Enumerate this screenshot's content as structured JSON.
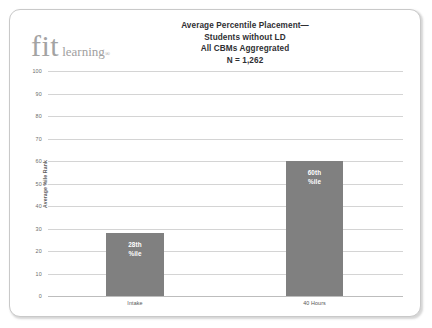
{
  "logo": {
    "primary": "fit",
    "secondary": "learning",
    "registered": "®"
  },
  "title": {
    "line1": "Average Percentile Placement—",
    "line2": "Students without LD",
    "line3": "All CBMs Aggregrated",
    "line4": "N = 1,262"
  },
  "colors": {
    "bar": "#808080",
    "gridline": "#d4d4d4",
    "title_text": "#2f2f33",
    "logo": "#a3a3a3",
    "bar_label": "#ffffff"
  },
  "chart_data": {
    "type": "bar",
    "title": "Average Percentile Placement— Students without LD All CBMs Aggregrated N = 1,262",
    "xlabel": "",
    "ylabel": "Average %ile Rank",
    "categories": [
      "Intake",
      "40 Hours"
    ],
    "values": [
      28,
      60
    ],
    "data_labels": [
      "28th %ile",
      "60th %ile"
    ],
    "bar_label_lines": [
      [
        "28th",
        "%ile"
      ],
      [
        "60th",
        "%ile"
      ]
    ],
    "ylim": [
      0,
      100
    ],
    "ytick_step": 10,
    "yticks": [
      "100",
      "90",
      "80",
      "70",
      "60",
      "50",
      "40",
      "30",
      "20",
      "10",
      "0"
    ],
    "grid": true,
    "legend": false,
    "legend_position": "none",
    "series": [
      {
        "name": "Average %ile Rank",
        "values": [
          28,
          60
        ]
      }
    ]
  }
}
